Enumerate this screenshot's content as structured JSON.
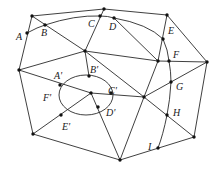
{
  "diagram": {
    "labels": {
      "A": "A",
      "B": "B",
      "C": "C",
      "D": "D",
      "E": "E",
      "F": "F",
      "G": "G",
      "H": "H",
      "I": "I",
      "A_prime": "A'",
      "B_prime": "B'",
      "C_prime": "C'",
      "D_prime": "D'",
      "E_prime": "E'",
      "F_prime": "F'"
    },
    "colors": {
      "stroke": "#2a2a2a",
      "vertex": "#111111",
      "label": "#222222"
    }
  }
}
